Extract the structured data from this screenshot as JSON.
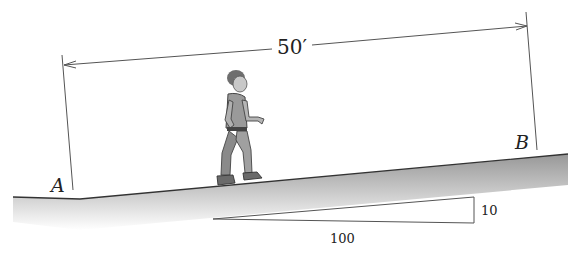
{
  "figure": {
    "dimension_label": "50′",
    "point_a_label": "A",
    "point_b_label": "B",
    "slope_triangle": {
      "rise_label": "10",
      "run_label": "100"
    },
    "colors": {
      "line": "#444444",
      "ground_shade": "#9a9a9a",
      "background": "#ffffff"
    }
  }
}
